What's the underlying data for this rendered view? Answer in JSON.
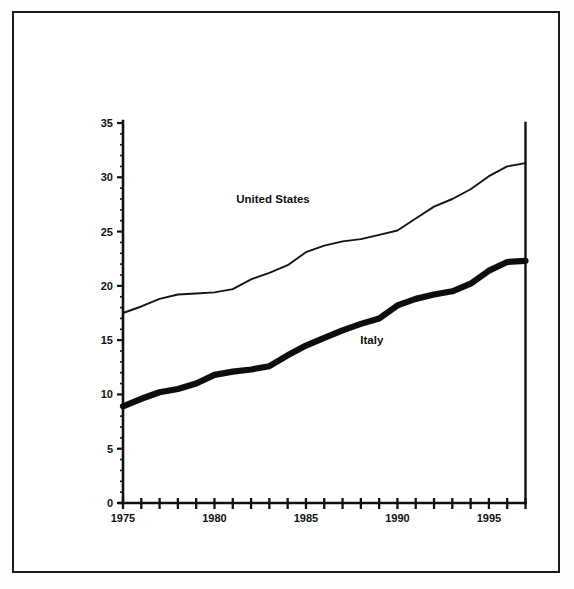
{
  "chart_data": {
    "type": "line",
    "title": "",
    "subtitle": "",
    "xlabel": "",
    "ylabel": "",
    "xlim": [
      1975,
      1997
    ],
    "ylim": [
      0,
      35
    ],
    "grid": false,
    "legend_position": "inline-annotation",
    "y_ticks": [
      0,
      5,
      10,
      15,
      20,
      25,
      30,
      35
    ],
    "y_tick_labels": [
      "0",
      "5",
      "10",
      "15",
      "20",
      "25",
      "30",
      "35"
    ],
    "y_minor_tick_step": 1,
    "x_ticks": [
      1975,
      1976,
      1977,
      1978,
      1979,
      1980,
      1981,
      1982,
      1983,
      1984,
      1985,
      1986,
      1987,
      1988,
      1989,
      1990,
      1991,
      1992,
      1993,
      1994,
      1995,
      1996,
      1997
    ],
    "x_tick_labels": [
      "1975",
      "1980",
      "1985",
      "1990",
      "1995"
    ],
    "x_labeled_ticks": [
      1975,
      1980,
      1985,
      1990,
      1995
    ],
    "x": [
      1975,
      1976,
      1977,
      1978,
      1979,
      1980,
      1981,
      1982,
      1983,
      1984,
      1985,
      1986,
      1987,
      1988,
      1989,
      1990,
      1991,
      1992,
      1993,
      1994,
      1995,
      1996,
      1997
    ],
    "series": [
      {
        "name": "United States",
        "style": "thin-line",
        "color": "#141414",
        "label_x": 1983.2,
        "label_y": 27.6,
        "values": [
          17.5,
          18.1,
          18.8,
          19.2,
          19.3,
          19.4,
          19.7,
          20.6,
          21.2,
          21.9,
          23.1,
          23.7,
          24.1,
          24.3,
          24.7,
          25.1,
          26.2,
          27.3,
          28.0,
          28.9,
          30.1,
          31.0,
          31.3
        ]
      },
      {
        "name": "Italy",
        "style": "thick-line",
        "color": "#0d0d0d",
        "label_x": 1988.6,
        "label_y": 14.6,
        "values": [
          8.9,
          9.6,
          10.2,
          10.5,
          11.0,
          11.8,
          12.1,
          12.3,
          12.6,
          13.6,
          14.5,
          15.2,
          15.9,
          16.5,
          17.0,
          18.2,
          18.8,
          19.2,
          19.5,
          20.2,
          21.4,
          22.2,
          22.3
        ]
      }
    ]
  },
  "annotations": {
    "series_labels": [
      {
        "text": "United States"
      },
      {
        "text": "Italy"
      }
    ]
  }
}
